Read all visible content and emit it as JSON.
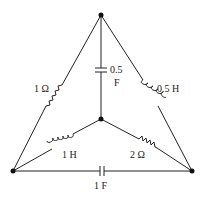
{
  "diagram": {
    "type": "circuit",
    "nodes": [
      {
        "id": "top",
        "x": 101,
        "y": 15
      },
      {
        "id": "center",
        "x": 101,
        "y": 119
      },
      {
        "id": "bottom-left",
        "x": 13,
        "y": 171
      },
      {
        "id": "bottom-right",
        "x": 192,
        "y": 171
      }
    ],
    "components": [
      {
        "id": "r1",
        "kind": "resistor",
        "label": "1 Ω",
        "from": "top",
        "to": "bottom-left"
      },
      {
        "id": "c1",
        "kind": "capacitor",
        "label_line1": "0.5",
        "label_line2": "F",
        "from": "top",
        "to": "center"
      },
      {
        "id": "l1",
        "kind": "inductor",
        "label": "0.5 H",
        "from": "top",
        "to": "bottom-right"
      },
      {
        "id": "l2",
        "kind": "inductor",
        "label": "1 H",
        "from": "center",
        "to": "bottom-left"
      },
      {
        "id": "r2",
        "kind": "resistor",
        "label": "2 Ω",
        "from": "center",
        "to": "bottom-right"
      },
      {
        "id": "c2",
        "kind": "capacitor",
        "label": "1 F",
        "from": "bottom-left",
        "to": "bottom-right"
      }
    ]
  },
  "labels": {
    "r1": "1 Ω",
    "c1_line1": "0.5",
    "c1_line2": "F",
    "l1": "0.5 H",
    "l2": "1 H",
    "r2": "2 Ω",
    "c2": "1 F"
  }
}
